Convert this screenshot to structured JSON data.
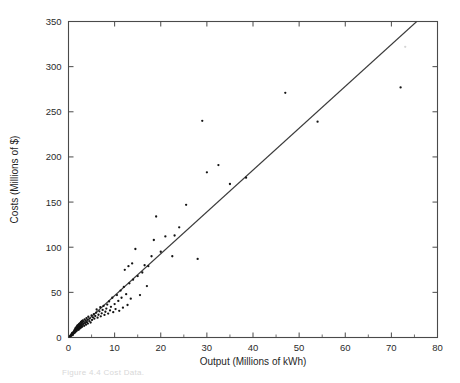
{
  "figure": {
    "caption": "Figure 4.4  Cost Data.",
    "background": "#ffffff",
    "point_color": "#141414",
    "line_color": "#3a3a3a",
    "axis_color": "#4a4a4a"
  },
  "chart_data": {
    "type": "scatter",
    "title": "",
    "subtitle": "",
    "xlabel": "Output (Millions of kWh)",
    "ylabel": "Costs (Millions of $)",
    "xlim": [
      0,
      80
    ],
    "ylim": [
      0,
      350
    ],
    "xticks": [
      0,
      10,
      20,
      30,
      40,
      50,
      60,
      70,
      80
    ],
    "yticks": [
      0,
      50,
      100,
      150,
      200,
      250,
      300,
      350
    ],
    "xtick_labels": [
      "0",
      "10",
      "20",
      "30",
      "40",
      "50",
      "60",
      "70",
      "80"
    ],
    "ytick_labels": [
      "0",
      "50",
      "100",
      "150",
      "200",
      "250",
      "300",
      "350"
    ],
    "x_minor_step": 5,
    "grid": false,
    "legend": null,
    "frame": "box",
    "tick_direction": "in",
    "series": [
      {
        "name": "fitted regression line",
        "type": "line",
        "x": [
          0,
          75.5
        ],
        "y": [
          0,
          350
        ]
      },
      {
        "name": "observations",
        "type": "scatter",
        "marker": "dot",
        "points": [
          [
            0.3,
            1.2
          ],
          [
            0.4,
            2.0
          ],
          [
            0.5,
            1.6
          ],
          [
            0.6,
            3.1
          ],
          [
            0.6,
            2.2
          ],
          [
            0.7,
            4.0
          ],
          [
            0.7,
            2.8
          ],
          [
            0.8,
            3.5
          ],
          [
            0.8,
            5.1
          ],
          [
            0.9,
            4.2
          ],
          [
            0.9,
            2.6
          ],
          [
            1.0,
            5.5
          ],
          [
            1.0,
            3.8
          ],
          [
            1.1,
            6.2
          ],
          [
            1.1,
            4.6
          ],
          [
            1.2,
            7.0
          ],
          [
            1.2,
            5.0
          ],
          [
            1.3,
            8.1
          ],
          [
            1.3,
            6.0
          ],
          [
            1.4,
            9.0
          ],
          [
            1.4,
            5.4
          ],
          [
            1.5,
            10.2
          ],
          [
            1.5,
            7.2
          ],
          [
            1.6,
            8.5
          ],
          [
            1.6,
            11.0
          ],
          [
            1.7,
            6.8
          ],
          [
            1.7,
            9.6
          ],
          [
            1.8,
            12.0
          ],
          [
            1.8,
            8.0
          ],
          [
            1.9,
            10.5
          ],
          [
            1.9,
            13.2
          ],
          [
            2.0,
            9.0
          ],
          [
            2.0,
            11.8
          ],
          [
            2.1,
            14.0
          ],
          [
            2.1,
            10.0
          ],
          [
            2.2,
            12.5
          ],
          [
            2.2,
            8.6
          ],
          [
            2.3,
            15.0
          ],
          [
            2.3,
            11.2
          ],
          [
            2.4,
            13.6
          ],
          [
            2.4,
            9.8
          ],
          [
            2.5,
            16.0
          ],
          [
            2.5,
            12.0
          ],
          [
            2.6,
            14.5
          ],
          [
            2.6,
            10.6
          ],
          [
            2.7,
            17.2
          ],
          [
            2.7,
            13.0
          ],
          [
            2.8,
            15.5
          ],
          [
            2.8,
            11.4
          ],
          [
            2.9,
            18.0
          ],
          [
            2.9,
            14.0
          ],
          [
            3.0,
            16.4
          ],
          [
            3.0,
            12.2
          ],
          [
            3.1,
            19.0
          ],
          [
            3.2,
            15.0
          ],
          [
            3.3,
            17.5
          ],
          [
            3.4,
            13.0
          ],
          [
            3.5,
            20.0
          ],
          [
            3.6,
            16.0
          ],
          [
            3.7,
            18.6
          ],
          [
            3.8,
            14.2
          ],
          [
            3.9,
            21.5
          ],
          [
            4.0,
            17.0
          ],
          [
            4.1,
            19.8
          ],
          [
            4.2,
            15.4
          ],
          [
            4.3,
            23.0
          ],
          [
            4.5,
            18.2
          ],
          [
            4.6,
            21.0
          ],
          [
            4.8,
            16.6
          ],
          [
            5.0,
            24.5
          ],
          [
            5.1,
            19.5
          ],
          [
            5.3,
            22.4
          ],
          [
            5.5,
            26.0
          ],
          [
            5.6,
            20.8
          ],
          [
            5.8,
            23.8
          ],
          [
            6.0,
            27.5
          ],
          [
            6.1,
            31.0
          ],
          [
            6.3,
            22.0
          ],
          [
            6.5,
            25.2
          ],
          [
            6.7,
            29.0
          ],
          [
            6.9,
            33.5
          ],
          [
            7.0,
            23.5
          ],
          [
            7.2,
            26.8
          ],
          [
            7.4,
            30.5
          ],
          [
            7.6,
            35.0
          ],
          [
            7.8,
            25.0
          ],
          [
            8.0,
            28.5
          ],
          [
            8.2,
            32.0
          ],
          [
            8.4,
            36.5
          ],
          [
            8.6,
            26.5
          ],
          [
            8.8,
            40.0
          ],
          [
            9.0,
            30.0
          ],
          [
            9.2,
            34.0
          ],
          [
            9.5,
            44.0
          ],
          [
            9.7,
            28.0
          ],
          [
            10.0,
            37.0
          ],
          [
            10.2,
            31.5
          ],
          [
            10.5,
            47.0
          ],
          [
            10.8,
            40.5
          ],
          [
            11.0,
            29.5
          ],
          [
            11.3,
            52.0
          ],
          [
            11.5,
            44.0
          ],
          [
            11.8,
            33.0
          ],
          [
            12.0,
            56.0
          ],
          [
            12.2,
            75.0
          ],
          [
            12.5,
            48.0
          ],
          [
            12.8,
            36.0
          ],
          [
            13.0,
            79.0
          ],
          [
            13.2,
            60.0
          ],
          [
            13.5,
            43.0
          ],
          [
            13.8,
            82.0
          ],
          [
            14.0,
            64.0
          ],
          [
            14.5,
            98.0
          ],
          [
            15.0,
            68.0
          ],
          [
            15.5,
            47.0
          ],
          [
            16.0,
            72.0
          ],
          [
            16.5,
            80.0
          ],
          [
            17.0,
            57.0
          ],
          [
            17.3,
            79.0
          ],
          [
            18.0,
            90.0
          ],
          [
            18.5,
            108.0
          ],
          [
            19.0,
            134.0
          ],
          [
            20.0,
            95.0
          ],
          [
            21.0,
            112.0
          ],
          [
            22.5,
            90.0
          ],
          [
            23.0,
            113.0
          ],
          [
            24.0,
            122.0
          ],
          [
            25.5,
            147.0
          ],
          [
            28.0,
            87.0
          ],
          [
            29.0,
            240.0
          ],
          [
            30.0,
            183.0
          ],
          [
            32.5,
            191.0
          ],
          [
            35.0,
            170.0
          ],
          [
            38.5,
            177.0
          ],
          [
            47.0,
            271.0
          ],
          [
            54.0,
            239.0
          ],
          [
            72.0,
            277.0
          ]
        ]
      },
      {
        "name": "faint observation",
        "type": "scatter",
        "marker": "dot-faint",
        "points": [
          [
            73.0,
            322.0
          ]
        ]
      }
    ]
  }
}
